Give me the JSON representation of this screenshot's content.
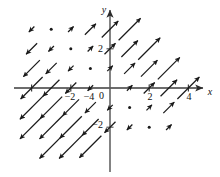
{
  "figure": {
    "title": "",
    "background_color": "#ffffff",
    "ink_color": "#1a1a1a",
    "width": 220,
    "height": 177
  },
  "axes": {
    "x_axis": {
      "name": "x-axis",
      "label": "x",
      "tick_labels": [
        "−4",
        "−2",
        "2",
        "4"
      ],
      "tick_values": [
        -4,
        -2,
        2,
        4
      ],
      "range": [
        -5.0,
        5.0
      ],
      "has_arrowhead": true
    },
    "y_axis": {
      "name": "y-axis",
      "label": "y",
      "tick_labels": [
        "2",
        "−2"
      ],
      "tick_values": [
        2,
        -2
      ],
      "range": [
        -3.4,
        3.2
      ],
      "has_arrowhead": true
    },
    "origin_label": "0",
    "grid": false
  },
  "chart_data": {
    "type": "scatter",
    "subtype": "vector-field",
    "title": "",
    "xlabel": "x",
    "ylabel": "y",
    "xlim": [
      -5.0,
      5.0
    ],
    "ylim": [
      -3.4,
      3.2
    ],
    "xticks": [
      -4,
      -2,
      2,
      4
    ],
    "yticks": [
      2,
      -2
    ],
    "grid": false,
    "legend": null,
    "vector_direction_unit": [
      0.7071,
      0.7071
    ],
    "zero_vector_marker": "dot",
    "vectors": [
      {
        "x": -4,
        "y": 3,
        "u": -0.5,
        "v": -0.5
      },
      {
        "x": -3,
        "y": 3,
        "u": 0,
        "v": 0
      },
      {
        "x": -2,
        "y": 3,
        "u": 0.5,
        "v": 0.5
      },
      {
        "x": -1,
        "y": 3,
        "u": 1.0,
        "v": 1.0
      },
      {
        "x": 0,
        "y": 3,
        "u": 1.5,
        "v": 1.5
      },
      {
        "x": 1,
        "y": 3,
        "u": 2.0,
        "v": 2.0
      },
      {
        "x": -4,
        "y": 2,
        "u": -1.0,
        "v": -1.0
      },
      {
        "x": -3,
        "y": 2,
        "u": -0.5,
        "v": -0.5
      },
      {
        "x": -2,
        "y": 2,
        "u": 0,
        "v": 0
      },
      {
        "x": -1,
        "y": 2,
        "u": 0.5,
        "v": 0.5
      },
      {
        "x": 0,
        "y": 2,
        "u": 1.0,
        "v": 1.0
      },
      {
        "x": 1,
        "y": 2,
        "u": 1.5,
        "v": 1.5
      },
      {
        "x": 2,
        "y": 2,
        "u": 2.0,
        "v": 2.0
      },
      {
        "x": -4,
        "y": 1,
        "u": -1.5,
        "v": -1.5
      },
      {
        "x": -3,
        "y": 1,
        "u": -1.0,
        "v": -1.0
      },
      {
        "x": -2,
        "y": 1,
        "u": -0.5,
        "v": -0.5
      },
      {
        "x": -1,
        "y": 1,
        "u": 0,
        "v": 0
      },
      {
        "x": 0,
        "y": 1,
        "u": 0.5,
        "v": 0.5
      },
      {
        "x": 1,
        "y": 1,
        "u": 1.0,
        "v": 1.0
      },
      {
        "x": 2,
        "y": 1,
        "u": 1.5,
        "v": 1.5
      },
      {
        "x": 3,
        "y": 1,
        "u": 2.0,
        "v": 2.0
      },
      {
        "x": -4,
        "y": 0,
        "u": -2.0,
        "v": -2.0
      },
      {
        "x": -3,
        "y": 0,
        "u": -1.5,
        "v": -1.5
      },
      {
        "x": -2,
        "y": 0,
        "u": -1.0,
        "v": -1.0
      },
      {
        "x": -1,
        "y": 0,
        "u": -0.5,
        "v": -0.5
      },
      {
        "x": 1,
        "y": 0,
        "u": 0.5,
        "v": 0.5
      },
      {
        "x": 2,
        "y": 0,
        "u": 1.0,
        "v": 1.0
      },
      {
        "x": 3,
        "y": 0,
        "u": 1.5,
        "v": 1.5
      },
      {
        "x": 4,
        "y": 0,
        "u": 2.0,
        "v": 2.0
      },
      {
        "x": -4,
        "y": -1,
        "u": -2.5,
        "v": -2.5
      },
      {
        "x": -3,
        "y": -1,
        "u": -2.0,
        "v": -2.0
      },
      {
        "x": -2,
        "y": -1,
        "u": -1.5,
        "v": -1.5
      },
      {
        "x": -1,
        "y": -1,
        "u": -1.0,
        "v": -1.0
      },
      {
        "x": 0,
        "y": -1,
        "u": -0.5,
        "v": -0.5
      },
      {
        "x": 1,
        "y": -1,
        "u": 0,
        "v": 0
      },
      {
        "x": 2,
        "y": -1,
        "u": 0.5,
        "v": 0.5
      },
      {
        "x": 3,
        "y": -1,
        "u": 1.0,
        "v": 1.0
      },
      {
        "x": -4,
        "y": -2,
        "u": -3.0,
        "v": -3.0
      },
      {
        "x": -3,
        "y": -2,
        "u": -2.5,
        "v": -2.5
      },
      {
        "x": -2,
        "y": -2,
        "u": -2.0,
        "v": -2.0
      },
      {
        "x": -1,
        "y": -2,
        "u": -1.5,
        "v": -1.5
      },
      {
        "x": 0,
        "y": -2,
        "u": -1.0,
        "v": -1.0
      },
      {
        "x": 1,
        "y": -2,
        "u": -0.5,
        "v": -0.5
      },
      {
        "x": 2,
        "y": -2,
        "u": 0,
        "v": 0
      },
      {
        "x": 3,
        "y": -2,
        "u": 0.5,
        "v": 0.5
      },
      {
        "x": -3,
        "y": -3,
        "u": -3.0,
        "v": -3.0
      },
      {
        "x": -2,
        "y": -3,
        "u": -2.5,
        "v": -2.5
      },
      {
        "x": -1,
        "y": -3,
        "u": -2.0,
        "v": -2.0
      }
    ]
  }
}
